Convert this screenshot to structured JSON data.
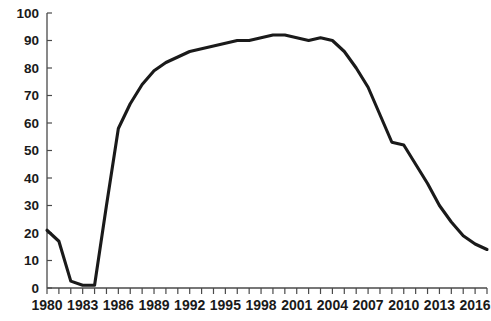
{
  "chart_data": {
    "type": "line",
    "title": "",
    "subtitle": "",
    "xlabel": "",
    "ylabel": "",
    "xlim": [
      1980,
      2017
    ],
    "ylim": [
      0,
      100
    ],
    "grid": false,
    "legend": null,
    "y_ticks": [
      0,
      10,
      20,
      30,
      40,
      50,
      60,
      70,
      80,
      90,
      100
    ],
    "y_tick_labels": [
      "0",
      "10",
      "20",
      "30",
      "40",
      "50",
      "60",
      "70",
      "80",
      "90",
      "100"
    ],
    "x_ticks": [
      1980,
      1981,
      1982,
      1983,
      1984,
      1985,
      1986,
      1987,
      1988,
      1989,
      1990,
      1991,
      1992,
      1993,
      1994,
      1995,
      1996,
      1997,
      1998,
      1999,
      2000,
      2001,
      2002,
      2003,
      2004,
      2005,
      2006,
      2007,
      2008,
      2009,
      2010,
      2011,
      2012,
      2013,
      2014,
      2015,
      2016,
      2017
    ],
    "x_tick_labels": [
      "1980",
      "1983",
      "1986",
      "1989",
      "1992",
      "1995",
      "1998",
      "2001",
      "2004",
      "2007",
      "2010",
      "2013",
      "2016"
    ],
    "x_tick_label_years": [
      1980,
      1983,
      1986,
      1989,
      1992,
      1995,
      1998,
      2001,
      2004,
      2007,
      2010,
      2013,
      2016
    ],
    "series": [
      {
        "name": "series-1",
        "color": "#1a1a1a",
        "x": [
          1980,
          1981,
          1982,
          1983,
          1984,
          1985,
          1986,
          1987,
          1988,
          1989,
          1990,
          1991,
          1992,
          1993,
          1994,
          1995,
          1996,
          1997,
          1998,
          1999,
          2000,
          2001,
          2002,
          2003,
          2004,
          2005,
          2006,
          2007,
          2008,
          2009,
          2010,
          2011,
          2012,
          2013,
          2014,
          2015,
          2016,
          2017
        ],
        "values": [
          21,
          17,
          2.5,
          1,
          1,
          30,
          58,
          67,
          74,
          79,
          82,
          84,
          86,
          87,
          88,
          89,
          90,
          90,
          91,
          92,
          92,
          91,
          90,
          91,
          90,
          86,
          80,
          73,
          63,
          53,
          52,
          45,
          38,
          30,
          24,
          19,
          16,
          14
        ]
      }
    ]
  },
  "axis": {
    "y_axis_name": "y-axis",
    "x_axis_name": "x-axis"
  }
}
